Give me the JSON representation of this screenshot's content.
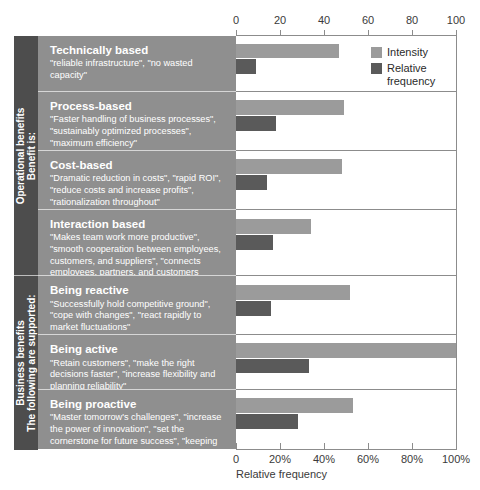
{
  "chart_data": {
    "type": "bar",
    "orientation": "horizontal",
    "title": "",
    "xlabel": "Relative frequency",
    "ylabel": "",
    "xlim": [
      0,
      100
    ],
    "grid": false,
    "legend_position": "top-right",
    "top_axis": {
      "ticks": [
        0,
        20,
        40,
        60,
        80,
        100
      ],
      "tick_labels": [
        "0",
        "20",
        "40",
        "60",
        "80",
        "100"
      ]
    },
    "bottom_axis": {
      "ticks": [
        0,
        20,
        40,
        60,
        80,
        100
      ],
      "tick_labels": [
        "0",
        "20%",
        "40%",
        "60%",
        "80%",
        "100%"
      ],
      "label": "Relative frequency"
    },
    "legend": [
      {
        "name": "Intensity",
        "color": "#9b9b9b"
      },
      {
        "name": "Relative frequency",
        "color": "#5a5a5a"
      }
    ],
    "series": [
      {
        "name": "Intensity",
        "color": "#9b9b9b",
        "values": [
          47,
          49,
          48,
          34,
          52,
          100,
          53
        ]
      },
      {
        "name": "Relative frequency",
        "color": "#5a5a5a",
        "values": [
          9,
          18,
          14,
          17,
          16,
          33,
          28
        ]
      }
    ],
    "categories": [
      "Technically based",
      "Process-based",
      "Cost-based",
      "Interaction based",
      "Being reactive",
      "Being active",
      "Being proactive"
    ]
  },
  "sections": [
    {
      "line1": "Operational benefits",
      "line2": "Benefit is:",
      "rows": 4
    },
    {
      "line1": "Business benefits",
      "line2": "The following are supported:",
      "rows": 3
    }
  ],
  "rows": [
    {
      "title": "Technically based",
      "quotes": "\"reliable infrastructure\", \"no wasted capacity\"",
      "intensity": 47,
      "relative_frequency": 9
    },
    {
      "title": "Process-based",
      "quotes": "\"Faster handling of business processes\", \"sustainably optimized processes\", \"maximum efficiency\"",
      "intensity": 49,
      "relative_frequency": 18
    },
    {
      "title": "Cost-based",
      "quotes": "\"Dramatic reduction in costs\", \"rapid ROI\", \"reduce costs and increase profits\", \"rationalization throughout\"",
      "intensity": 48,
      "relative_frequency": 14
    },
    {
      "title": "Interaction based",
      "quotes": "\"Makes team work more productive\", \"smooth cooperation between employees, customers, and suppliers\", \"connects employees, partners, and customers throughout the world\"",
      "intensity": 34,
      "relative_frequency": 17
    },
    {
      "title": "Being reactive",
      "quotes": "\"Successfully hold competitive ground\", \"cope with changes\", \"react rapidly to market fluctuations\"",
      "intensity": 52,
      "relative_frequency": 16
    },
    {
      "title": "Being active",
      "quotes": "\"Retain customers\", \"make the right decisions faster\", \"increase flexibility and planning reliability\"",
      "intensity": 100,
      "relative_frequency": 33
    },
    {
      "title": "Being proactive",
      "quotes": "\"Master tomorrow's challenges\", \"increase the power of innovation\", \"set the cornerstone for future success\", \"keeping ahead in terms of technology\"",
      "intensity": 53,
      "relative_frequency": 28
    }
  ]
}
